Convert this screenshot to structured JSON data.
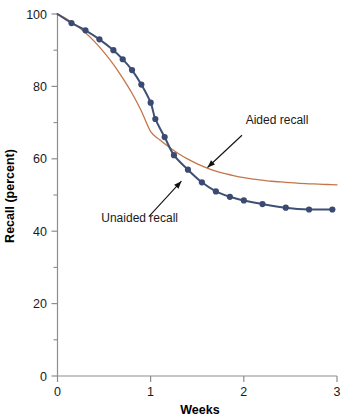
{
  "chart_data": {
    "type": "line",
    "title": "",
    "subtitle": "",
    "xlabel": "Weeks",
    "ylabel": "Recall (percent)",
    "xlim": [
      0,
      3
    ],
    "ylim": [
      0,
      100
    ],
    "xticks": [
      "0",
      "1",
      "2",
      "3"
    ],
    "xtick_values": [
      0,
      1,
      2,
      3
    ],
    "yticks": [
      "0",
      "20",
      "40",
      "60",
      "80",
      "100"
    ],
    "ytick_values": [
      0,
      20,
      40,
      60,
      80,
      100
    ],
    "y_minor_ticks": [
      10,
      30,
      50,
      70,
      90
    ],
    "grid": false,
    "legend_position": "inline-annotations",
    "series": [
      {
        "name": "Aided recall",
        "color": "#c4764a",
        "markers": false,
        "x": [
          0.0,
          0.1,
          0.2,
          0.3,
          0.4,
          0.5,
          0.6,
          0.7,
          0.8,
          0.9,
          1.0,
          1.1,
          1.2,
          1.3,
          1.4,
          1.5,
          1.6,
          1.7,
          1.8,
          1.9,
          2.0,
          2.1,
          2.2,
          2.3,
          2.4,
          2.5,
          2.6,
          2.7,
          2.8,
          2.9,
          3.0
        ],
        "values": [
          100.0,
          98.6,
          96.9,
          94.8,
          92.3,
          89.4,
          86.1,
          82.3,
          78.1,
          73.2,
          67.5,
          65.2,
          63.2,
          61.4,
          59.9,
          58.6,
          57.5,
          56.6,
          55.9,
          55.3,
          54.8,
          54.4,
          54.1,
          53.8,
          53.6,
          53.4,
          53.2,
          53.1,
          53.0,
          52.9,
          52.8
        ]
      },
      {
        "name": "Unaided recall",
        "color": "#3f5074",
        "marker_color": "#3b4a72",
        "markers": true,
        "x": [
          0.0,
          0.15,
          0.3,
          0.45,
          0.6,
          0.7,
          0.8,
          0.9,
          1.0,
          1.05,
          1.15,
          1.25,
          1.4,
          1.55,
          1.7,
          1.85,
          2.0,
          2.2,
          2.45,
          2.7,
          2.95
        ],
        "values": [
          100.0,
          97.5,
          95.5,
          93.0,
          90.0,
          87.5,
          84.5,
          80.5,
          75.5,
          71.0,
          66.0,
          61.0,
          57.0,
          53.5,
          51.0,
          49.5,
          48.5,
          47.5,
          46.5,
          46.0,
          46.0
        ],
        "marker_x": [
          0.15,
          0.3,
          0.45,
          0.6,
          0.7,
          0.8,
          0.9,
          1.0,
          1.05,
          1.15,
          1.25,
          1.4,
          1.55,
          1.7,
          1.85,
          2.0,
          2.2,
          2.45,
          2.7,
          2.95
        ],
        "marker_values": [
          97.5,
          95.5,
          93.0,
          90.0,
          87.5,
          84.5,
          80.5,
          75.5,
          71.0,
          66.0,
          61.0,
          57.0,
          53.5,
          51.0,
          49.5,
          48.5,
          47.5,
          46.5,
          46.0,
          46.0
        ]
      }
    ],
    "annotations": [
      {
        "label": "Aided recall",
        "text_x": 2.02,
        "text_y": 69.5,
        "arrow_from_x": 1.98,
        "arrow_from_y": 66.5,
        "arrow_to_x": 1.61,
        "arrow_to_y": 57.6
      },
      {
        "label": "Unaided recall",
        "text_x": 0.47,
        "text_y": 42.5,
        "arrow_from_x": 0.98,
        "arrow_from_y": 44.0,
        "arrow_to_x": 1.33,
        "arrow_to_y": 53.8
      }
    ]
  },
  "axes": {
    "x_axis_label": "Weeks",
    "y_axis_label": "Recall (percent)",
    "axis_color": "#8a8a8a"
  }
}
